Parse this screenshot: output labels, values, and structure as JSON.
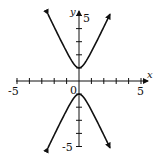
{
  "chart_data": {
    "type": "line",
    "title": "",
    "xlabel": "x",
    "ylabel": "y",
    "xlim": [
      -5,
      5
    ],
    "ylim": [
      -5,
      5
    ],
    "grid": false,
    "x_ticks": [
      -5,
      -4,
      -3,
      -2,
      -1,
      0,
      1,
      2,
      3,
      4,
      5
    ],
    "y_ticks": [
      -5,
      -4,
      -3,
      -2,
      -1,
      0,
      1,
      2,
      3,
      4,
      5
    ],
    "tick_labels": {
      "x_min": "-5",
      "x_max": "5",
      "y_min": "-5",
      "y_max": "5",
      "origin": "0"
    },
    "equation_estimate": "y^2 - 4x^2 = 1",
    "series": [
      {
        "name": "upper branch",
        "x": [
          -2.5,
          -2,
          -1.5,
          -1,
          -0.5,
          0,
          0.5,
          1,
          1.5,
          2,
          2.5
        ],
        "y": [
          5.1,
          4.12,
          3.16,
          2.24,
          1.41,
          1,
          1.41,
          2.24,
          3.16,
          4.12,
          5.1
        ],
        "arrows": "both ends"
      },
      {
        "name": "lower branch",
        "x": [
          -2.5,
          -2,
          -1.5,
          -1,
          -0.5,
          0,
          0.5,
          1,
          1.5,
          2,
          2.5
        ],
        "y": [
          -5.1,
          -4.12,
          -3.16,
          -2.24,
          -1.41,
          -1,
          -1.41,
          -2.24,
          -3.16,
          -4.12,
          -5.1
        ],
        "arrows": "both ends"
      }
    ]
  },
  "labels": {
    "x_axis": "x",
    "y_axis": "y",
    "x_min": "-5",
    "x_max": "5",
    "y_max": "5",
    "y_min": "-5",
    "origin": "0"
  },
  "colors": {
    "axis": "#111111",
    "curve": "#111111",
    "background": "#ffffff"
  }
}
